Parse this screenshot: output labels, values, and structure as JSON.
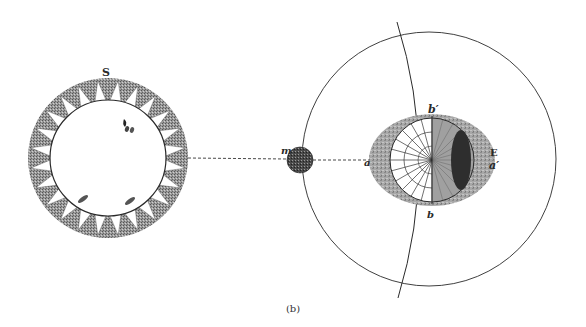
{
  "figure": {
    "caption": "(b)",
    "labels": {
      "sun": "S",
      "moon": "m",
      "earth": "E",
      "point_a": "a",
      "point_a_prime": "a′",
      "point_b": "b",
      "point_b_prime": "b′"
    },
    "colors": {
      "ink": "#2a2a2a",
      "shade_dark": "#3a3a3a",
      "shade_mid": "#8a8a8a",
      "shade_light": "#b5b5b5",
      "paper": "#ffffff"
    },
    "elements": {
      "sun": {
        "cx": 108,
        "cy": 158,
        "outer_r": 80,
        "inner_r": 58,
        "rays": 24,
        "spots": 4
      },
      "moon": {
        "cx": 300,
        "cy": 160,
        "r": 13
      },
      "moon_orbit": {
        "cx": 429,
        "cy": 159,
        "r": 127
      },
      "earth": {
        "cx": 432,
        "cy": 160,
        "rx": 63,
        "ry": 46,
        "globe_r": 42
      },
      "sun_moon_line": {
        "style": "dashed"
      }
    }
  }
}
